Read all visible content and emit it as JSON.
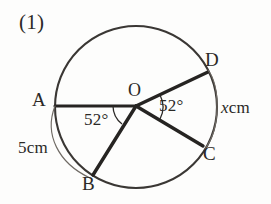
{
  "figure": {
    "problem_number": "(1)",
    "center_label": "O",
    "points": [
      {
        "name": "A",
        "label": "A"
      },
      {
        "name": "B",
        "label": "B"
      },
      {
        "name": "C",
        "label": "C"
      },
      {
        "name": "D",
        "label": "D"
      }
    ],
    "angles": [
      {
        "name": "angle-aob",
        "label": "52°",
        "value": 52,
        "unit": "degrees",
        "between": "OA-OB"
      },
      {
        "name": "angle-doc",
        "label": "52°",
        "value": 52,
        "unit": "degrees",
        "between": "OD-OC"
      }
    ],
    "arc_measures": [
      {
        "name": "arc-ab",
        "label": "5cm",
        "value": "5",
        "unit": "cm",
        "arc": "AB"
      },
      {
        "name": "arc-dc",
        "label_var": "x",
        "label_unit": "cm",
        "unit": "cm",
        "arc": "DC"
      }
    ],
    "colors": {
      "ink": "#2b2926",
      "stroke_heavy": "#262422",
      "stroke_circle": "#3a3734",
      "stroke_thin": "#6f6a64",
      "background": "#fdfdfc"
    }
  }
}
